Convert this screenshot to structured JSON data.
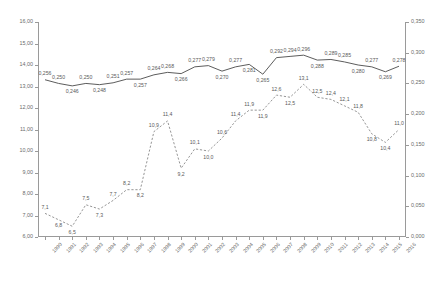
{
  "chart_data": {
    "type": "line",
    "title": "",
    "subtitle": "",
    "xlabel": "",
    "ylabel": "",
    "grid": false,
    "legend": "none",
    "categories": [
      "1990",
      "1991",
      "1992",
      "1993",
      "1994",
      "1995",
      "1996",
      "1997",
      "1998",
      "1999",
      "2000",
      "2001",
      "2002",
      "2003",
      "2004",
      "2005",
      "2006",
      "2007",
      "2008",
      "2009",
      "2010",
      "2011",
      "2012",
      "2013",
      "2014",
      "2015",
      "2016"
    ],
    "axes": {
      "left": {
        "min": 6.0,
        "max": 16.0,
        "step": 1.0,
        "ticks": [
          "6,00",
          "7,00",
          "8,00",
          "9,00",
          "10,00",
          "11,00",
          "12,00",
          "13,00",
          "14,00",
          "15,00",
          "16,00"
        ],
        "tick_values": [
          6,
          7,
          8,
          9,
          10,
          11,
          12,
          13,
          14,
          15,
          16
        ]
      },
      "right": {
        "min": 0.0,
        "max": 0.35,
        "step": 0.05,
        "ticks": [
          "0,000",
          "0,050",
          "0,100",
          "0,150",
          "0,200",
          "0,250",
          "0,300",
          "0,350"
        ],
        "tick_values": [
          0,
          0.05,
          0.1,
          0.15,
          0.2,
          0.25,
          0.3,
          0.35
        ]
      }
    },
    "series": [
      {
        "name": "solid-series",
        "axis": "right",
        "style": "solid",
        "color": "#4a4a4a",
        "values": [
          0.256,
          0.25,
          0.246,
          0.25,
          0.248,
          0.251,
          0.257,
          0.257,
          0.264,
          0.268,
          0.266,
          0.277,
          0.279,
          0.27,
          0.277,
          0.281,
          0.265,
          0.292,
          0.294,
          0.296,
          0.288,
          0.289,
          0.285,
          0.28,
          0.277,
          0.269,
          0.278
        ],
        "labels": [
          "0,256",
          "0,250",
          "0,246",
          "0,250",
          "0,248",
          "0,251",
          "0,257",
          "0,257",
          "0,264",
          "0,268",
          "0,266",
          "0,277",
          "0,279",
          "0,270",
          "0,277",
          "0,281",
          "0,265",
          "0,292",
          "0,294",
          "0,296",
          "0,288",
          "0,289",
          "0,285",
          "0,280",
          "0,277",
          "0,269",
          "0,278"
        ],
        "label_positions": [
          "above",
          "above",
          "below",
          "above",
          "below",
          "above",
          "above",
          "below",
          "above",
          "above",
          "below",
          "above",
          "above",
          "below",
          "above",
          "below",
          "below",
          "above",
          "above",
          "above",
          "below",
          "above",
          "above",
          "below",
          "above",
          "below",
          "above"
        ]
      },
      {
        "name": "dashed-series",
        "axis": "left",
        "style": "dashed",
        "color": "#8a8a8a",
        "values": [
          7.1,
          6.8,
          6.5,
          7.5,
          7.3,
          7.7,
          8.2,
          8.2,
          10.9,
          11.4,
          9.2,
          10.1,
          10.0,
          10.6,
          11.4,
          11.9,
          11.9,
          12.6,
          12.5,
          13.1,
          12.5,
          12.4,
          12.1,
          11.8,
          10.8,
          10.4,
          11.0
        ],
        "labels": [
          "7,1",
          "6,8",
          "6,5",
          "7,5",
          "7,3",
          "7,7",
          "8,2",
          "8,2",
          "10,9",
          "11,4",
          "9,2",
          "10,1",
          "10,0",
          "10,6",
          "11,4",
          "11,9",
          "11,9",
          "12,6",
          "12,5",
          "13,1",
          "12,5",
          "12,4",
          "12,1",
          "11,8",
          "10,8",
          "10,4",
          "11,0"
        ],
        "label_positions": [
          "above",
          "below",
          "below",
          "above",
          "below",
          "above",
          "above",
          "below",
          "above",
          "above",
          "below",
          "above",
          "below",
          "above",
          "above",
          "above",
          "below",
          "above",
          "below",
          "above",
          "above",
          "above",
          "above",
          "above",
          "below",
          "below",
          "above"
        ]
      }
    ]
  }
}
